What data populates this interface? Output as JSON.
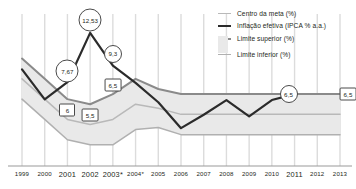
{
  "chart_data": {
    "type": "line",
    "title": "",
    "subtitle": "",
    "xlabel": "",
    "ylabel": "",
    "grid": "vertical",
    "legend_position": "top-right",
    "categories": [
      "1999",
      "2000",
      "2001",
      "2002",
      "2003*",
      "2004*",
      "2005",
      "2006",
      "2007",
      "2008",
      "2009",
      "2010",
      "2011",
      "2012",
      "2013"
    ],
    "ylim": [
      0,
      14
    ],
    "series": [
      {
        "name": "Centro da meta (%)",
        "color": "#b9b9b9",
        "values": [
          8,
          6,
          4,
          3.5,
          4,
          5.5,
          5.1,
          4.5,
          4.5,
          4.5,
          4.5,
          4.5,
          4.5,
          4.5,
          4.5
        ]
      },
      {
        "name": "Inflação efetiva (IPCA % a.a.)",
        "color": "#2b2b2b",
        "values": [
          8.94,
          5.97,
          7.67,
          12.53,
          9.3,
          7.6,
          5.69,
          3.14,
          4.46,
          5.9,
          4.31,
          5.91,
          6.5,
          null,
          null
        ]
      },
      {
        "name": "Limite superior (%)",
        "color": "#8a8a8a",
        "values": [
          10,
          8,
          6,
          5.5,
          6.5,
          8,
          7,
          6.5,
          6.5,
          6.5,
          6.5,
          6.5,
          6.5,
          6.5,
          6.5
        ]
      },
      {
        "name": "Limite inferior (%)",
        "color": "#b0b0b0",
        "values": [
          6,
          4,
          2,
          1.5,
          1.5,
          3,
          3.2,
          2.5,
          2.5,
          2.5,
          2.5,
          2.5,
          2.5,
          2.5,
          2.5
        ]
      }
    ],
    "band": {
      "name": "Intervalo de tolerância",
      "fill": "#e9e9e9",
      "upper_series": "Limite superior (%)",
      "lower_series": "Limite inferior (%)"
    },
    "annotations": [
      {
        "text": "7,67",
        "shape": "circle",
        "category": "2001",
        "series": "Inflação efetiva (IPCA % a.a.)",
        "value": 7.67
      },
      {
        "text": "12,53",
        "shape": "circle",
        "category": "2002",
        "series": "Inflação efetiva (IPCA % a.a.)",
        "value": 12.53
      },
      {
        "text": "9,3",
        "shape": "circle",
        "category": "2003*",
        "series": "Inflação efetiva (IPCA % a.a.)",
        "value": 9.3
      },
      {
        "text": "6",
        "shape": "box",
        "category": "2001",
        "series": "Limite superior (%)",
        "value": 6
      },
      {
        "text": "5,5",
        "shape": "box",
        "category": "2002",
        "series": "Limite superior (%)",
        "value": 5.5
      },
      {
        "text": "6,5",
        "shape": "box",
        "category": "2003*",
        "series": "Limite superior (%)",
        "value": 6.5
      },
      {
        "text": "6,5",
        "shape": "circle",
        "category": "2011",
        "series": "Limite superior (%)",
        "value": 6.5
      },
      {
        "text": "6,5",
        "shape": "box",
        "category": "2013",
        "series": "Limite superior (%)",
        "value": 6.5
      }
    ]
  },
  "legend": {
    "items": [
      {
        "label": "Centro da meta (%)",
        "swatch": "centro"
      },
      {
        "label": "Inflação efetiva (IPCA % a.a.)",
        "swatch": "infl"
      },
      {
        "label": "Limite superior (%)",
        "swatch": "sup"
      },
      {
        "label": "Limite inferior (%)",
        "swatch": "inf"
      }
    ]
  },
  "colors": {
    "background": "#ffffff",
    "gridline": "#dcdcdc",
    "axis": "#9a9a9a",
    "band_fill": "#e9e9e9",
    "inflation_line": "#2b2b2b",
    "upper_line": "#8a8a8a",
    "center_line": "#b9b9b9",
    "lower_line": "#b0b0b0",
    "label_border": "#4a4a4a",
    "text": "#231f20"
  }
}
